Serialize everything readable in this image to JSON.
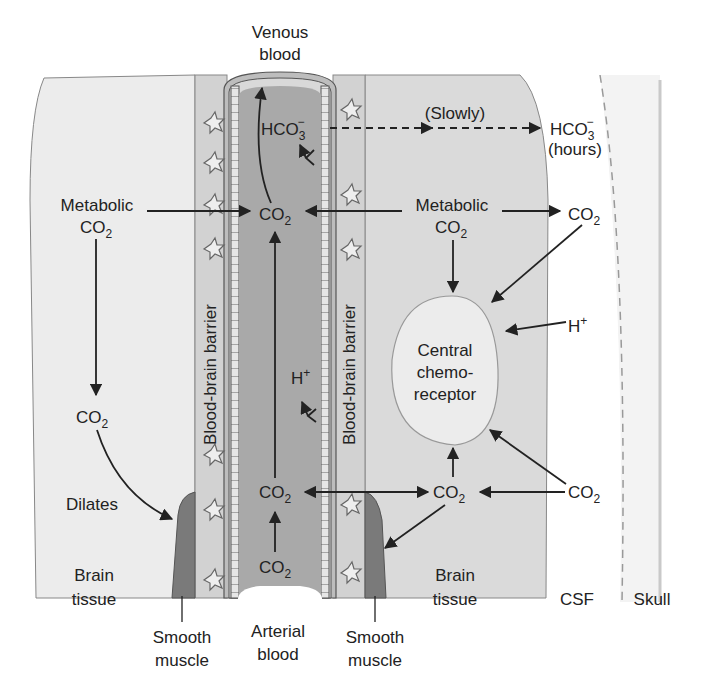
{
  "diagram": {
    "colors": {
      "brain_tissue_left": "#ececec",
      "brain_tissue_right": "#dadada",
      "barrier": "#d2d2d2",
      "vessel_lumen": "#a9a9a9",
      "vessel_wall": "#bdbdbd",
      "smooth_muscle": "#7a7a7a",
      "csf": "#ffffff",
      "skull": "#f3f3f3",
      "chemoreceptor": "#ececec",
      "ink": "#222222"
    },
    "labels": {
      "venous_blood_1": "Venous",
      "venous_blood_2": "blood",
      "arterial_blood_1": "Arterial",
      "arterial_blood_2": "blood",
      "slowly": "(Slowly)",
      "hco3_main": "HCO",
      "hco3_sub": "3",
      "hco3_sup": "−",
      "hours": "(hours)",
      "metabolic": "Metabolic",
      "co": "CO",
      "co_sub": "2",
      "h": "H",
      "h_sup": "+",
      "central_1": "Central",
      "central_2": "chemo-",
      "central_3": "receptor",
      "dilates": "Dilates",
      "brain_1": "Brain",
      "brain_2": "tissue",
      "csf": "CSF",
      "skull": "Skull",
      "smooth_1": "Smooth",
      "smooth_2": "muscle",
      "bbb": "Blood-brain barrier"
    }
  }
}
